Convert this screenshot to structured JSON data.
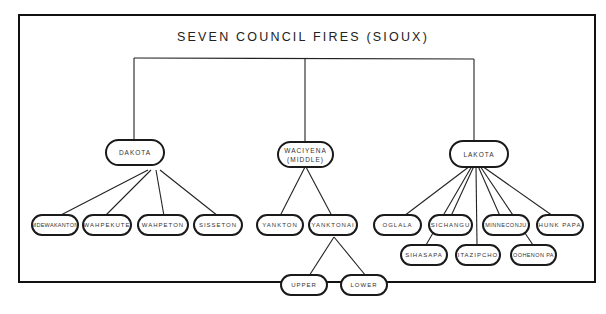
{
  "title": "SEVEN COUNCIL FIRES (SIOUX)",
  "groups": [
    {
      "label": "DAKOTA",
      "sublabel": ""
    },
    {
      "label": "WACIYENA",
      "sublabel": "(MIDDLE)"
    },
    {
      "label": "LAKOTA",
      "sublabel": ""
    }
  ],
  "dakota_bands": [
    "MDEWAKANTON",
    "WAHPEKUTE",
    "WAHPETON",
    "SISSETON"
  ],
  "middle_bands": [
    "YANKTON",
    "YANKTONAI"
  ],
  "yanktonai_divisions": [
    "UPPER",
    "LOWER"
  ],
  "lakota_bands": [
    "OGLALA",
    "SIHASAPA",
    "SICHANGU",
    "ITAZIPCHO",
    "MINNECONJU",
    "OOHENONPA",
    "HUNKPAPA"
  ],
  "lakota_display": [
    "OGLALA",
    "SIHASAPA",
    "SICHANGU",
    "ITAZIPCHO",
    "MINNECONJU",
    "OOHENON PA",
    "HUNK PAPA"
  ]
}
